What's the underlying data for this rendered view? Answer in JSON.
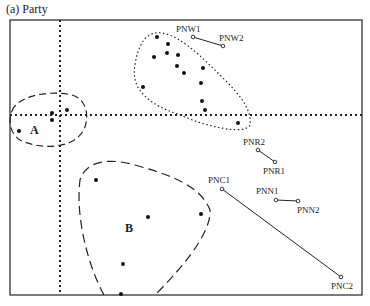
{
  "title": "(a) Party",
  "frame": {
    "x": 10,
    "y": 20,
    "width": 352,
    "height": 275
  },
  "axes": {
    "vertical_dotted_x": 60,
    "horizontal_dotted_y": 115
  },
  "clusters": [
    {
      "name": "A",
      "label": "A",
      "label_pos": [
        30,
        134
      ],
      "style": "dashed",
      "points": [
        [
          19,
          131
        ],
        [
          52,
          113
        ],
        [
          52,
          120
        ],
        [
          67,
          110
        ]
      ]
    },
    {
      "name": "B",
      "label": "B",
      "label_pos": [
        125,
        232
      ],
      "style": "dashed",
      "points": [
        [
          96,
          180
        ],
        [
          148,
          217
        ],
        [
          201,
          214
        ],
        [
          123,
          264
        ],
        [
          121,
          294
        ]
      ]
    },
    {
      "name": "upper",
      "label": "",
      "style": "dotted",
      "points": [
        [
          157,
          37
        ],
        [
          168,
          44
        ],
        [
          154,
          57
        ],
        [
          167,
          53
        ],
        [
          178,
          55
        ],
        [
          177,
          66
        ],
        [
          184,
          73
        ],
        [
          203,
          68
        ],
        [
          201,
          83
        ],
        [
          143,
          87
        ],
        [
          202,
          101
        ],
        [
          205,
          110
        ],
        [
          238,
          123
        ]
      ]
    }
  ],
  "pairs": [
    {
      "a": {
        "label": "PNW1",
        "pos": [
          193,
          37
        ],
        "label_pos": [
          176,
          32
        ]
      },
      "b": {
        "label": "PNW2",
        "pos": [
          223,
          46
        ],
        "label_pos": [
          219,
          41
        ]
      }
    },
    {
      "a": {
        "label": "PNR2",
        "pos": [
          258,
          150
        ],
        "label_pos": [
          243,
          145
        ]
      },
      "b": {
        "label": "PNR1",
        "pos": [
          275,
          162
        ],
        "label_pos": [
          263,
          174
        ]
      }
    },
    {
      "a": {
        "label": "PNC1",
        "pos": [
          222,
          189
        ],
        "label_pos": [
          208,
          183
        ]
      },
      "b": {
        "label": "PNC2",
        "pos": [
          341,
          277
        ],
        "label_pos": [
          331,
          289
        ]
      }
    },
    {
      "a": {
        "label": "PNN1",
        "pos": [
          276,
          200
        ],
        "label_pos": [
          256,
          194
        ]
      },
      "b": {
        "label": "PNN2",
        "pos": [
          298,
          201
        ],
        "label_pos": [
          297,
          213
        ]
      }
    }
  ]
}
